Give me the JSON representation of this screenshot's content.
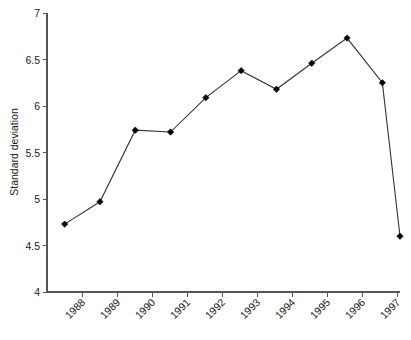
{
  "chart_data": {
    "type": "line",
    "title": "",
    "xlabel": "",
    "ylabel": "Standard deviation",
    "ylim": [
      4,
      7
    ],
    "ytick_labels": [
      "7",
      "6.5",
      "6",
      "5.5",
      "5",
      "4.5",
      "4"
    ],
    "ytick_values": [
      7,
      6.5,
      6,
      5.5,
      5,
      4.5,
      4
    ],
    "xtick_labels": [
      "1988",
      "1989",
      "1990",
      "1991",
      "1992",
      "1993",
      "1994",
      "1995",
      "1996",
      "1997"
    ],
    "grid": false,
    "legend": "none",
    "series": [
      {
        "name": "Standard deviation",
        "marker": "filled-diamond",
        "color": "#000000",
        "values": [
          4.73,
          4.97,
          5.74,
          5.72,
          6.09,
          6.38,
          6.18,
          6.46,
          6.73,
          6.25,
          4.6
        ]
      }
    ],
    "points": [
      {
        "index": 0,
        "value": 4.73
      },
      {
        "index": 1,
        "value": 4.97
      },
      {
        "index": 2,
        "value": 5.74
      },
      {
        "index": 3,
        "value": 5.72
      },
      {
        "index": 4,
        "value": 6.09
      },
      {
        "index": 5,
        "value": 6.38
      },
      {
        "index": 6,
        "value": 6.18
      },
      {
        "index": 7,
        "value": 6.46
      },
      {
        "index": 8,
        "value": 6.73
      },
      {
        "index": 9,
        "value": 6.25
      },
      {
        "index": 10,
        "value": 4.6
      }
    ]
  },
  "axes": {
    "y_title": "Standard deviation"
  }
}
